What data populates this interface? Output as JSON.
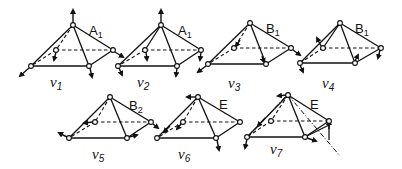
{
  "figure": {
    "modes": [
      {
        "id": "v1",
        "label": "ν",
        "sub": "1",
        "symmetry": "A",
        "symmetry_sub": "1"
      },
      {
        "id": "v2",
        "label": "ν",
        "sub": "2",
        "symmetry": "A",
        "symmetry_sub": "1"
      },
      {
        "id": "v3",
        "label": "ν",
        "sub": "3",
        "symmetry": "B",
        "symmetry_sub": "1"
      },
      {
        "id": "v4",
        "label": "ν",
        "sub": "4",
        "symmetry": "B",
        "symmetry_sub": "1"
      },
      {
        "id": "v5",
        "label": "ν",
        "sub": "5",
        "symmetry": "B",
        "symmetry_sub": "2"
      },
      {
        "id": "v6",
        "label": "ν",
        "sub": "6",
        "symmetry": "E",
        "symmetry_sub": ""
      },
      {
        "id": "v7",
        "label": "ν",
        "sub": "7",
        "symmetry": "E",
        "symmetry_sub": ""
      }
    ]
  }
}
